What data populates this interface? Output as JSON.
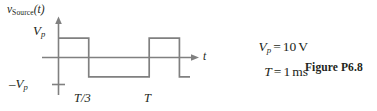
{
  "figure": {
    "caption": "Figure P6.8",
    "ylabel": {
      "base": "v",
      "subscript": "Source",
      "arg": "(t)"
    },
    "xlabel": "t",
    "y_ticks": [
      {
        "name": "vp",
        "base": "V",
        "subscript": "p",
        "prefix": ""
      },
      {
        "name": "neg-vp",
        "base": "V",
        "subscript": "p",
        "prefix": "–"
      }
    ],
    "x_ticks": [
      {
        "name": "t-over-3",
        "label": "T/3"
      },
      {
        "name": "t-period",
        "label": "T"
      }
    ],
    "given": [
      {
        "symbol": "V",
        "subscript": "p",
        "equals": "=",
        "value": "10",
        "unit": "V"
      },
      {
        "symbol": "T",
        "subscript": "",
        "equals": "=",
        "value": "1",
        "unit": "ms"
      }
    ],
    "colors": {
      "line": "#808080",
      "axis": "#808080",
      "text": "#231f20",
      "background": "#ffffff"
    }
  },
  "chart_data": {
    "type": "line",
    "title": "",
    "xlabel": "t",
    "ylabel": "v_Source(t)",
    "xlim": [
      0,
      1.45
    ],
    "ylim": [
      -1.45,
      1.45
    ],
    "grid": false,
    "legend": null,
    "x_tick_values": [
      0.3333,
      1
    ],
    "x_tick_labels": [
      "T/3",
      "T"
    ],
    "y_tick_values": [
      1,
      -1
    ],
    "y_tick_labels": [
      "V_p",
      "-V_p"
    ],
    "annotations": [
      "V_p = 10 V",
      "T = 1 ms"
    ],
    "series": [
      {
        "name": "v_Source(t)",
        "step": "post",
        "x": [
          0,
          0.3333,
          0.3333,
          1.0,
          1.0,
          1.3333,
          1.3333,
          1.45
        ],
        "y": [
          1,
          1,
          -1,
          -1,
          1,
          1,
          -1,
          -1
        ]
      }
    ]
  }
}
